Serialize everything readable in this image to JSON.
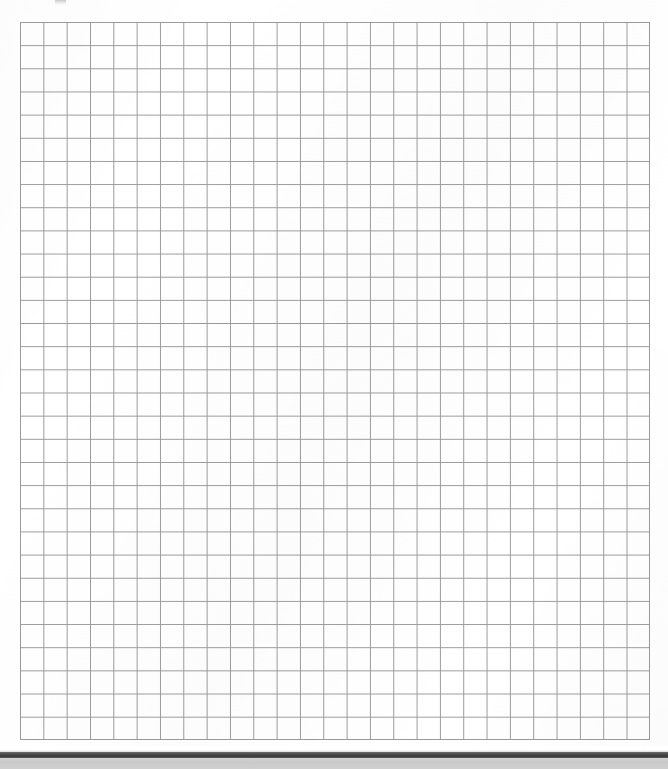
{
  "document": {
    "kind": "scanned-grid-paper",
    "page_width": 668,
    "page_height": 769,
    "background_color": "#ffffff",
    "caption": "Scanned sheet of blank square grid (graph) paper"
  },
  "grid": {
    "name": "square-grid",
    "columns": 27,
    "rows": 31,
    "cell_width_px": 23.33,
    "cell_height_px": 23.16,
    "origin_x_px": 20,
    "origin_y_px": 22,
    "width_px": 630,
    "height_px": 718,
    "line_color": "#9a9a9a",
    "line_width_px": 1,
    "fill_color": "#ffffff",
    "content": ""
  },
  "artifacts": {
    "top_smudge": {
      "name": "scan-smudge",
      "x_px": 55,
      "y_px": 0,
      "width_px": 11,
      "height_px": 5,
      "color": "#787878"
    },
    "dark_bar": {
      "name": "scanner-dark-bar",
      "x_px": 0,
      "y_px": 752,
      "width_px": 668,
      "height_px": 6,
      "color": "#4a4a4a"
    },
    "light_band": {
      "name": "scanner-light-band",
      "x_px": 0,
      "y_px": 758,
      "width_px": 668,
      "height_px": 11,
      "color": "#cdcdcd"
    }
  },
  "chart_data": {
    "type": "table",
    "title": "",
    "xlabel": "",
    "ylabel": "",
    "categories": [],
    "values": [],
    "grid": true,
    "legend": "none",
    "note": "Blank graph paper — no plotted data, only an empty 27 x 31 square grid."
  }
}
